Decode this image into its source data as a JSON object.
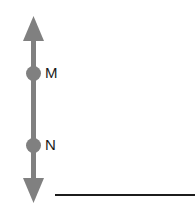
{
  "figure": {
    "type": "geometry-diagram",
    "width": 195,
    "height": 214,
    "background_color": "#ffffff",
    "colors": {
      "arrow_gray": "#808080",
      "point_gray": "#808080",
      "label_black": "#1a1a1a",
      "baseline_black": "#1c1c1c"
    },
    "vertical_arrow": {
      "name": "vertical-double-arrow",
      "orientation": "vertical",
      "arrowheads": "both-ends",
      "shaft_x": 33.5,
      "shaft_width": 5,
      "top_tip_y": 16,
      "bottom_tip_y": 203,
      "head_width": 21,
      "head_length": 25,
      "color": "#808080"
    },
    "points": [
      {
        "name": "point-m",
        "label": "M",
        "center_x": 33.5,
        "center_y": 73.5,
        "radius": 7.5,
        "label_x": 45,
        "label_y": 74
      },
      {
        "name": "point-n",
        "label": "N",
        "center_x": 33.5,
        "center_y": 145.5,
        "radius": 7.5,
        "label_x": 45,
        "label_y": 146
      }
    ],
    "baseline": {
      "name": "horizontal-baseline",
      "x1": 55,
      "x2": 195,
      "y": 195,
      "thickness": 2,
      "color": "#1c1c1c"
    }
  }
}
